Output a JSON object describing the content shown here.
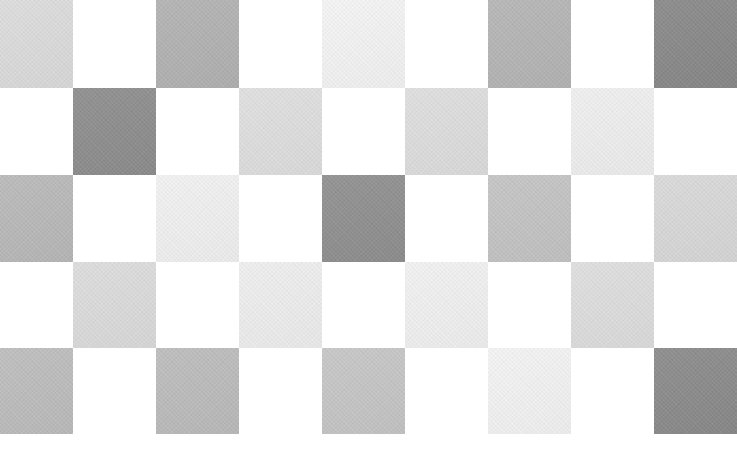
{
  "canvas": {
    "width": 737,
    "height": 475,
    "background_color": "#ffffff"
  },
  "pattern": {
    "description_colors": {
      "white": "#ffffff",
      "darkest_square": "#888888",
      "lightest_square": "#f5f5f5"
    },
    "column_boundaries_x": [
      0,
      73,
      156,
      239,
      322,
      405,
      488,
      571,
      654,
      737
    ],
    "row_boundaries_y": [
      0,
      88,
      175,
      262,
      348,
      434,
      475
    ],
    "cells": [
      [
        "#dcdcdc",
        "#ffffff",
        "#b2b2b2",
        "#ffffff",
        "#f5f5f5",
        "#ffffff",
        "#b5b5b5",
        "#ffffff",
        "#888888"
      ],
      [
        "#ffffff",
        "#8d8d8d",
        "#ffffff",
        "#dfdfdf",
        "#ffffff",
        "#dedede",
        "#ffffff",
        "#f0f0f0",
        "#ffffff"
      ],
      [
        "#b9b9b9",
        "#ffffff",
        "#f2f2f2",
        "#ffffff",
        "#8f8f8f",
        "#ffffff",
        "#c4c4c4",
        "#ffffff",
        "#d9d9d9"
      ],
      [
        "#ffffff",
        "#dcdcdc",
        "#ffffff",
        "#efefef",
        "#ffffff",
        "#f2f2f2",
        "#ffffff",
        "#dedede",
        "#ffffff"
      ],
      [
        "#bdbdbd",
        "#ffffff",
        "#bcbcbc",
        "#ffffff",
        "#c6c6c6",
        "#ffffff",
        "#f4f4f4",
        "#ffffff",
        "#8a8a8a"
      ],
      [
        "#ffffff",
        "#ffffff",
        "#ffffff",
        "#ffffff",
        "#ffffff",
        "#ffffff",
        "#ffffff",
        "#ffffff",
        "#ffffff"
      ]
    ]
  }
}
